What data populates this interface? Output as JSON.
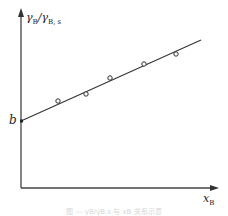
{
  "chart_data": {
    "type": "scatter",
    "title": "",
    "xlabel": "x_B",
    "ylabel": "γ_B/γ_B,s",
    "intercept_label": "b",
    "grid": false,
    "legend": null,
    "axis_ticks": "none",
    "points_px": [
      {
        "x": 58,
        "y": 101
      },
      {
        "x": 86,
        "y": 94
      },
      {
        "x": 110,
        "y": 78
      },
      {
        "x": 144,
        "y": 64
      },
      {
        "x": 176,
        "y": 54
      }
    ],
    "fit_line_px": {
      "x1": 21,
      "y1": 121,
      "x2": 201,
      "y2": 40
    },
    "axes_px": {
      "origin": {
        "x": 21,
        "y": 188
      },
      "x_end": 218,
      "y_end": 10
    }
  },
  "labels": {
    "y_main": "γ",
    "y_sub1": "B",
    "y_slash": "/γ",
    "y_sub2": "B, s",
    "x_main": "x",
    "x_sub": "B",
    "intercept": "b"
  },
  "caption": "图 — γB/γB,s 与 xB 关系示意"
}
